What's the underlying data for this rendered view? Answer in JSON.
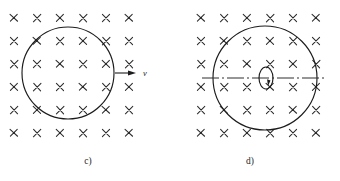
{
  "figure": {
    "width": 340,
    "height": 181,
    "background_color": "#ffffff",
    "ink_color": "#1c1c1c"
  },
  "panels": [
    {
      "id": "panel-c",
      "caption": "c)",
      "caption_x": 88,
      "caption_y": 164,
      "field": {
        "symbol": "x",
        "meaning": "magnetic-field-into-page",
        "columns": 6,
        "rows": 6,
        "origin_x": 14,
        "origin_y": 18,
        "step_x": 23,
        "step_y": 23,
        "arm": 3.6
      },
      "loop": {
        "shape": "circle",
        "cx": 68,
        "cy": 73,
        "r": 46
      },
      "velocity_arrow": {
        "label": "v",
        "label_x": 143,
        "label_y": 76,
        "x1": 115,
        "y1": 73,
        "x2": 136,
        "y2": 73,
        "head_length": 8,
        "head_width": 5
      },
      "axis": null
    },
    {
      "id": "panel-d",
      "caption": "d)",
      "caption_x": 250,
      "caption_y": 164,
      "field": {
        "symbol": "x",
        "meaning": "magnetic-field-into-page",
        "columns": 6,
        "rows": 6,
        "origin_x": 201,
        "origin_y": 18,
        "step_x": 23,
        "step_y": 23,
        "arm": 3.6
      },
      "loop": {
        "shape": "circle",
        "cx": 265,
        "cy": 78,
        "r": 52
      },
      "velocity_arrow": null,
      "axis": {
        "type": "dash-dot-center-line",
        "x1": 202,
        "y1": 78,
        "x2": 325,
        "y2": 78,
        "dash_pattern": "17 3 2 3",
        "rotation_marker": {
          "shape": "ellipse",
          "cx": 266,
          "cy": 78,
          "rx": 7,
          "ry": 11,
          "wedge": "filled-arrow-wedge"
        }
      }
    }
  ]
}
